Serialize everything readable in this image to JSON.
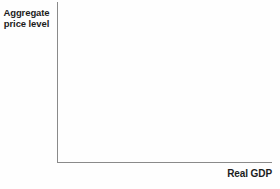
{
  "chart_data": {
    "type": "line",
    "title": "",
    "xlabel": "Real GDP",
    "ylabel": "Aggregate price level",
    "ylabel_line1": "Aggregate",
    "ylabel_line2": "price level",
    "series": [],
    "x_range": null,
    "y_range": null,
    "grid": false,
    "legend": false
  },
  "colors": {
    "background": "#fefefe",
    "axis_line": "#8a8a8a",
    "label_text": "#1c1c1c"
  }
}
